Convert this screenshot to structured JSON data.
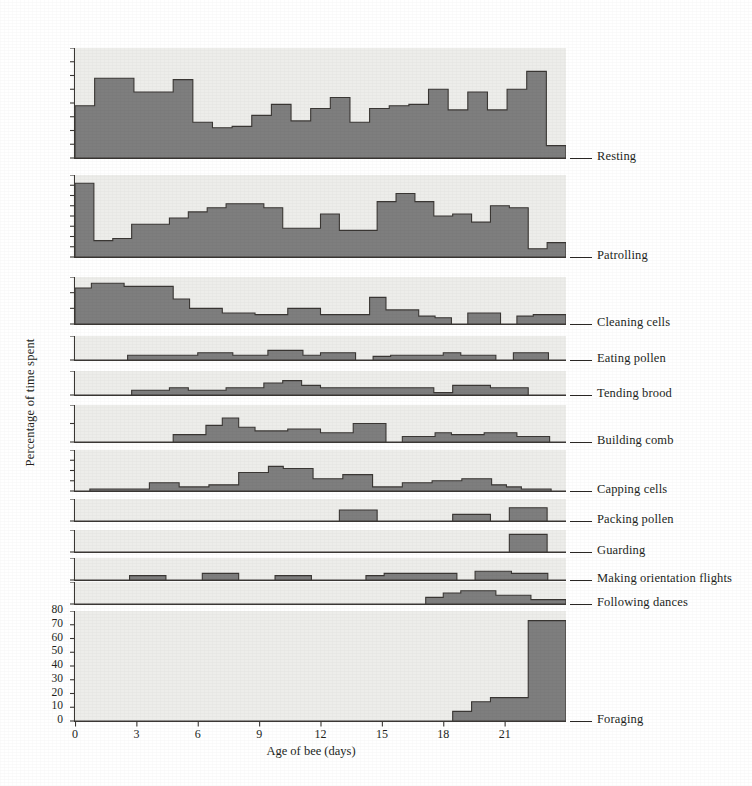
{
  "figure": {
    "xlabel": "Age of bee (days)",
    "ylabel": "Percentage of time spent",
    "plot_bg": "#ededea",
    "fill_color": "#7e7e7e",
    "line_color": "#3a3734",
    "xticks": [
      0,
      3,
      6,
      9,
      12,
      15,
      18,
      21
    ],
    "xlim": [
      0,
      24
    ],
    "bottom_yticks": [
      0,
      10,
      20,
      30,
      40,
      50,
      60,
      70,
      80
    ]
  },
  "chart_data": {
    "type": "area",
    "title": "",
    "subtitle": "",
    "xlabel": "Age of bee (days)",
    "ylabel": "Percentage of time spent",
    "xlim": [
      0,
      24
    ],
    "grid": false,
    "legend": "right-side row labels",
    "x": [
      0,
      1,
      2,
      3,
      4,
      5,
      6,
      7,
      8,
      9,
      10,
      11,
      12,
      13,
      14,
      15,
      16,
      17,
      18,
      19,
      20,
      21,
      22,
      23
    ],
    "panels": [
      {
        "name": "Resting",
        "ylim": [
          0,
          80
        ],
        "yticks": [
          0,
          10,
          20,
          30,
          40,
          50,
          60,
          70,
          80
        ],
        "values": [
          38,
          58,
          58,
          48,
          48,
          57,
          26,
          22,
          23,
          31,
          39,
          27,
          36,
          44,
          26,
          36,
          38,
          39,
          50,
          35,
          48,
          35,
          50,
          63,
          9
        ]
      },
      {
        "name": "Patrolling",
        "ylim": [
          0,
          40
        ],
        "yticks": [
          0,
          5,
          10,
          15,
          20,
          25,
          30,
          35,
          40
        ],
        "values": [
          36,
          8,
          9,
          16,
          16,
          19,
          22,
          24,
          26,
          26,
          24,
          14,
          14,
          21,
          13,
          13,
          27,
          31,
          27,
          20,
          21,
          17,
          25,
          24,
          4,
          7
        ]
      },
      {
        "name": "Cleaning cells",
        "ylim": [
          0,
          30
        ],
        "yticks": [
          0,
          10,
          20,
          30
        ],
        "values": [
          23,
          26,
          26,
          24,
          24,
          24,
          16,
          10,
          10,
          7,
          7,
          6,
          6,
          10,
          10,
          6,
          6,
          6,
          17,
          9,
          9,
          5,
          4,
          0,
          7,
          7,
          0,
          5,
          6,
          6
        ]
      },
      {
        "name": "Eating pollen",
        "ylim": [
          0,
          10
        ],
        "yticks": [
          0,
          10
        ],
        "values": [
          0,
          0,
          0,
          2,
          2,
          2,
          2,
          3,
          3,
          2,
          2,
          4,
          4,
          2,
          3,
          3,
          0,
          1.5,
          2,
          2,
          2,
          3,
          2,
          2,
          0,
          3,
          3,
          0
        ]
      },
      {
        "name": "Tending brood",
        "ylim": [
          0,
          10
        ],
        "yticks": [
          0,
          10
        ],
        "values": [
          0,
          0,
          0,
          2,
          2,
          3,
          2,
          2,
          3,
          3,
          5,
          6,
          4,
          3,
          3,
          3,
          3,
          3,
          3,
          1,
          4,
          4,
          3,
          3,
          0,
          0
        ]
      },
      {
        "name": "Building comb",
        "ylim": [
          0,
          20
        ],
        "yticks": [
          0,
          10,
          20
        ],
        "values": [
          0,
          0,
          0,
          0,
          0,
          0,
          4,
          4,
          9,
          13,
          8,
          6,
          6,
          7,
          7,
          5,
          5,
          10,
          10,
          0,
          3,
          3,
          5,
          4,
          4,
          5,
          5,
          3,
          3,
          0
        ]
      },
      {
        "name": "Capping cells",
        "ylim": [
          0,
          20
        ],
        "yticks": [
          0,
          5,
          10,
          15,
          20
        ],
        "values": [
          0,
          1,
          1,
          1,
          1,
          4,
          4,
          2,
          2,
          3,
          3,
          9,
          9,
          12,
          11,
          11,
          6,
          6,
          8,
          8,
          2,
          2,
          4,
          4,
          5,
          5,
          6,
          6,
          3,
          2,
          1,
          1,
          0
        ]
      },
      {
        "name": "Packing pollen",
        "ylim": [
          0,
          10
        ],
        "yticks": [
          0,
          10
        ],
        "values": [
          0,
          0,
          0,
          0,
          0,
          0,
          0,
          0,
          0,
          0,
          0,
          0,
          0,
          0,
          5,
          5,
          0,
          0,
          0,
          0,
          3,
          3,
          0,
          6,
          6,
          0
        ]
      },
      {
        "name": "Guarding",
        "ylim": [
          0,
          10
        ],
        "yticks": [
          0,
          10
        ],
        "values": [
          0,
          0,
          0,
          0,
          0,
          0,
          0,
          0,
          0,
          0,
          0,
          0,
          0,
          0,
          0,
          0,
          0,
          0,
          0,
          0,
          0,
          0,
          0,
          8,
          8,
          0
        ]
      },
      {
        "name": "Making orientation flights",
        "ylim": [
          0,
          10
        ],
        "yticks": [
          0,
          10
        ],
        "values": [
          0,
          0,
          0,
          2,
          2,
          0,
          0,
          3,
          3,
          0,
          0,
          2,
          2,
          0,
          0,
          0,
          2,
          3,
          3,
          3,
          3,
          0,
          4,
          4,
          3,
          3,
          0
        ]
      },
      {
        "name": "Following dances",
        "ylim": [
          0,
          10
        ],
        "yticks": [
          0,
          10
        ],
        "values": [
          0,
          0,
          0,
          0,
          0,
          0,
          0,
          0,
          0,
          0,
          0,
          0,
          0,
          0,
          0,
          0,
          0,
          0,
          0,
          0,
          3,
          5,
          6,
          6,
          4,
          4,
          2,
          2
        ]
      },
      {
        "name": "Foraging",
        "ylim": [
          0,
          80
        ],
        "yticks": [
          0,
          10,
          20,
          30,
          40,
          50,
          60,
          70,
          80
        ],
        "values": [
          0,
          0,
          0,
          0,
          0,
          0,
          0,
          0,
          0,
          0,
          0,
          0,
          0,
          0,
          0,
          0,
          0,
          0,
          0,
          0,
          7,
          14,
          17,
          17,
          73,
          73
        ]
      }
    ]
  },
  "row_labels": [
    "Resting",
    "Patrolling",
    "Cleaning cells",
    "Eating pollen",
    "Tending brood",
    "Building comb",
    "Capping cells",
    "Packing pollen",
    "Guarding",
    "Making orientation flights",
    "Following dances",
    "Foraging"
  ],
  "xtick_labels": [
    "0",
    "3",
    "6",
    "9",
    "12",
    "15",
    "18",
    "21"
  ],
  "ytick_labels_bottom": [
    "80",
    "70",
    "60",
    "50",
    "40",
    "30",
    "20",
    "10",
    "0"
  ]
}
